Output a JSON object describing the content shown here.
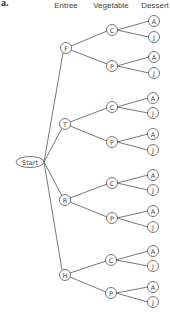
{
  "part_label": "a.",
  "headers": {
    "entree": "Entree",
    "vegetable": "Vegetable",
    "dessert": "Dessert"
  },
  "start_label": "Start",
  "tree": {
    "root": "Start",
    "entrees": [
      {
        "label": "F",
        "vegetables": [
          {
            "label": "C",
            "desserts": [
              "A",
              "J"
            ]
          },
          {
            "label": "P",
            "desserts": [
              "A",
              "J"
            ]
          }
        ]
      },
      {
        "label": "T",
        "vegetables": [
          {
            "label": "C",
            "desserts": [
              "A",
              "J"
            ]
          },
          {
            "label": "P",
            "desserts": [
              "A",
              "J"
            ]
          }
        ]
      },
      {
        "label": "R",
        "vegetables": [
          {
            "label": "C",
            "desserts": [
              "A",
              "J"
            ]
          },
          {
            "label": "P",
            "desserts": [
              "A",
              "J"
            ]
          }
        ]
      },
      {
        "label": "H",
        "vegetables": [
          {
            "label": "C",
            "desserts": [
              "A",
              "J"
            ]
          },
          {
            "label": "P",
            "desserts": [
              "A",
              "J"
            ]
          }
        ]
      }
    ]
  },
  "nodes": {
    "e0": "F",
    "e1": "T",
    "e2": "R",
    "e3": "H",
    "v0_0": "C",
    "v0_1": "P",
    "v1_0": "C",
    "v1_1": "P",
    "v2_0": "C",
    "v2_1": "P",
    "v3_0": "C",
    "v3_1": "P",
    "d0_0_0": "A",
    "d0_0_1": "J",
    "d0_1_0": "A",
    "d0_1_1": "J",
    "d1_0_0": "A",
    "d1_0_1": "J",
    "d1_1_0": "A",
    "d1_1_1": "J",
    "d2_0_0": "A",
    "d2_0_1": "J",
    "d2_1_0": "A",
    "d2_1_1": "J",
    "d3_0_0": "A",
    "d3_0_1": "J",
    "d3_1_0": "A",
    "d3_1_1": "J"
  }
}
